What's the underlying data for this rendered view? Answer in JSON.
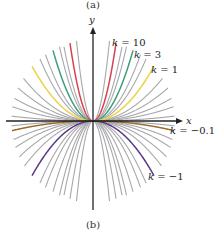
{
  "figure": {
    "top_caption": "(a)",
    "bottom_caption": "(b)",
    "x_axis_label": "x",
    "y_axis_label": "y",
    "equation_family": "y = kx^2"
  },
  "labels": [
    {
      "text": "k = 10",
      "k": 10,
      "x": 112,
      "y": 46
    },
    {
      "text": "k = 3",
      "k": 3,
      "x": 134,
      "y": 58
    },
    {
      "text": "k = 1",
      "k": 1,
      "x": 151,
      "y": 73
    },
    {
      "text": "k = −0.1",
      "k": -0.1,
      "x": 170,
      "y": 134
    },
    {
      "text": "k = −1",
      "k": -1,
      "x": 148,
      "y": 180
    }
  ],
  "colors": {
    "axis": "#222222",
    "grey": "#a8a8ac",
    "k10": "#d94050",
    "k3": "#3aa07a",
    "k1": "#ecd24a",
    "km01": "#9c6a2a",
    "km1": "#5a3a88"
  },
  "chart_data": {
    "type": "line",
    "title": "",
    "xlabel": "x",
    "ylabel": "y",
    "grid": false,
    "highlighted_series": [
      {
        "name": "k = 10",
        "k": 10,
        "color": "#d94050"
      },
      {
        "name": "k = 3",
        "k": 3,
        "color": "#3aa07a"
      },
      {
        "name": "k = 1",
        "k": 1,
        "color": "#ecd24a"
      },
      {
        "name": "k = -0.1",
        "k": -0.1,
        "color": "#9c6a2a"
      },
      {
        "name": "k = -1",
        "k": -1,
        "color": "#5a3a88"
      }
    ],
    "grey_k_values": [
      20,
      6,
      4.5,
      2,
      1.5,
      0.6,
      0.4,
      0.25,
      0.15,
      0.05,
      -0.05,
      -0.2,
      -0.3,
      -0.45,
      -0.65,
      -1.5,
      -2,
      -3,
      -4.5,
      -6,
      -10,
      -20
    ]
  }
}
